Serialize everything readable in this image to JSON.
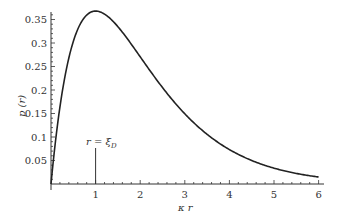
{
  "chart_data": {
    "type": "line",
    "title": "",
    "xlabel": "κ r",
    "ylabel": "p (r)",
    "xlim": [
      0,
      6
    ],
    "ylim": [
      0,
      0.37
    ],
    "grid": false,
    "legend": null,
    "x_ticks": [
      "1",
      "2",
      "3",
      "4",
      "5",
      "6"
    ],
    "y_ticks": [
      "0.05",
      "0.1",
      "0.15",
      "0.2",
      "0.25",
      "0.3",
      "0.35"
    ],
    "series": [
      {
        "name": "p(r)",
        "function": "κr·exp(-κr)",
        "x": [
          0,
          0.1,
          0.2,
          0.3,
          0.5,
          0.75,
          1.0,
          1.25,
          1.5,
          2.0,
          2.5,
          3.0,
          3.5,
          4.0,
          4.5,
          5.0,
          5.5,
          6.0
        ],
        "values": [
          0,
          0.09,
          0.164,
          0.222,
          0.303,
          0.354,
          0.368,
          0.358,
          0.335,
          0.271,
          0.205,
          0.149,
          0.106,
          0.073,
          0.05,
          0.034,
          0.022,
          0.015
        ]
      }
    ],
    "annotations": [
      {
        "text": "r = ξD",
        "x": 1.0,
        "marker": "vertical line from 0 to ~0.08"
      }
    ],
    "color": "#222222"
  },
  "labels": {
    "xlabel_kappa": "κ",
    "xlabel_r": "r",
    "ylabel": "p (r)",
    "annotation_lhs": "r = ξ",
    "annotation_sub": "D"
  }
}
